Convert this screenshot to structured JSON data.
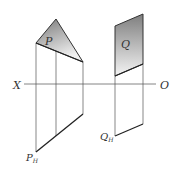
{
  "diagram": {
    "axis": {
      "left_label": "X",
      "right_label": "O"
    },
    "plane_p": {
      "label": "P",
      "projection_label": "P",
      "projection_subscript": "H"
    },
    "plane_q": {
      "label": "Q",
      "projection_label": "Q",
      "projection_subscript": "H"
    },
    "colors": {
      "line": "#333333",
      "thin_line": "#555555",
      "fill_dark": "#8a8a8a",
      "fill_light": "#f2f2f2"
    }
  }
}
